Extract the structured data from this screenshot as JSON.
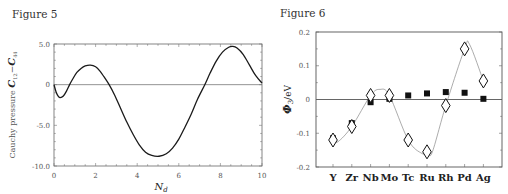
{
  "figures": [
    {
      "label": "Figure 5"
    },
    {
      "label": "Figure 6"
    }
  ],
  "chart_data": [
    {
      "type": "line",
      "title": "Figure 5",
      "xlabel": "N_d",
      "ylabel": "Cauchy pressure C12 - C44",
      "xlim": [
        0,
        10
      ],
      "ylim": [
        -10.0,
        5.0
      ],
      "xticks": [
        "0",
        "2",
        "4",
        "6",
        "8",
        "10"
      ],
      "yticks": [
        "5.0",
        "0",
        "-5.0",
        "-10.0"
      ],
      "zero_line": true,
      "series": [
        {
          "name": "C12-C44",
          "x": [
            0,
            0.1,
            0.2,
            0.3,
            0.45,
            0.6,
            0.75,
            0.9,
            1.1,
            1.3,
            1.5,
            1.75,
            2.0,
            2.2,
            2.45,
            2.65,
            2.9,
            3.2,
            3.5,
            3.8,
            4.1,
            4.4,
            4.7,
            5.05,
            5.4,
            5.7,
            6.0,
            6.3,
            6.6,
            6.9,
            7.25,
            7.5,
            7.8,
            8.1,
            8.4,
            8.6,
            8.8,
            9.1,
            9.4,
            9.7,
            10.0
          ],
          "y": [
            0,
            -0.9,
            -1.4,
            -1.6,
            -1.4,
            -0.8,
            0.0,
            0.7,
            1.5,
            2.0,
            2.3,
            2.4,
            2.2,
            1.7,
            0.8,
            0.0,
            -1.2,
            -2.9,
            -4.6,
            -6.1,
            -7.4,
            -8.3,
            -8.7,
            -8.8,
            -8.5,
            -7.8,
            -6.7,
            -5.2,
            -3.6,
            -1.8,
            0.0,
            1.4,
            2.9,
            4.0,
            4.6,
            4.7,
            4.5,
            3.7,
            2.4,
            1.1,
            0.2
          ]
        }
      ]
    },
    {
      "type": "scatter",
      "title": "Figure 6",
      "xlabel": "",
      "ylabel": "Φ3/eV",
      "categories": [
        "Y",
        "Zr",
        "Nb",
        "Mo",
        "Tc",
        "Ru",
        "Rh",
        "Pd",
        "Ag"
      ],
      "ylim": [
        -0.2,
        0.2
      ],
      "yticks": [
        "0.2",
        "0.1",
        "0",
        "-0.1",
        "-0.2"
      ],
      "zero_line": true,
      "series": [
        {
          "name": "open diamonds (with smooth fitted curve)",
          "marker": "diamond-open",
          "values": [
            -0.12,
            -0.08,
            0.012,
            0.012,
            -0.12,
            -0.155,
            -0.018,
            0.15,
            0.055
          ]
        },
        {
          "name": "filled squares",
          "marker": "square-filled",
          "values": [
            -0.115,
            -0.07,
            -0.008,
            0.002,
            0.012,
            0.018,
            0.022,
            0.02,
            0.002
          ]
        }
      ]
    }
  ]
}
